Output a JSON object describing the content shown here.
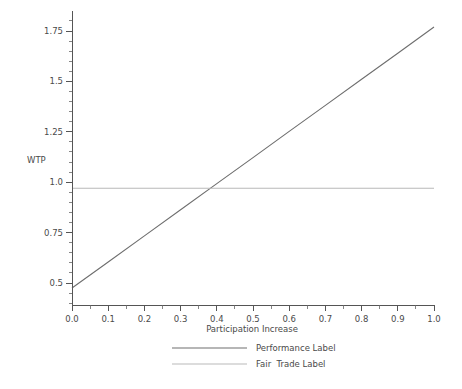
{
  "chart_data": {
    "type": "line",
    "title": "",
    "xlabel": "Participation Increase",
    "ylabel": "WTP",
    "xlim": [
      0.0,
      1.0
    ],
    "ylim": [
      0.45,
      1.85
    ],
    "grid": false,
    "legend_position": "bottom",
    "x_ticks": [
      "0.0",
      "0.1",
      "0.2",
      "0.3",
      "0.4",
      "0.5",
      "0.6",
      "0.7",
      "0.8",
      "0.9",
      "1.0"
    ],
    "x_tick_values": [
      0.0,
      0.1,
      0.2,
      0.3,
      0.4,
      0.5,
      0.6,
      0.7,
      0.8,
      0.9,
      1.0
    ],
    "y_ticks": [
      "0.5",
      "0.75",
      "1.0",
      "1.25",
      "1.5",
      "1.75"
    ],
    "y_tick_values": [
      0.5,
      0.75,
      1.0,
      1.25,
      1.5,
      1.75
    ],
    "x_minor_per_major": 1,
    "y_minor_per_major": 4,
    "series": [
      {
        "name": "Performance Label",
        "color": "#6e6e6e",
        "x": [
          0.0,
          0.1,
          0.2,
          0.3,
          0.4,
          0.5,
          0.6,
          0.7,
          0.8,
          0.9,
          1.0
        ],
        "values": [
          0.475,
          0.604,
          0.734,
          0.863,
          0.993,
          1.122,
          1.252,
          1.381,
          1.511,
          1.64,
          1.77
        ]
      },
      {
        "name": "Fair  Trade Label",
        "color": "#b9b9b9",
        "x": [
          0.0,
          1.0
        ],
        "values": [
          0.97,
          0.97
        ]
      }
    ]
  },
  "legend": {
    "entries": [
      {
        "label": "Performance Label",
        "color": "#6e6e6e"
      },
      {
        "label": "Fair  Trade Label",
        "color": "#b9b9b9"
      }
    ]
  },
  "axes": {
    "y_title": "WTP",
    "x_title": "Participation Increase"
  }
}
